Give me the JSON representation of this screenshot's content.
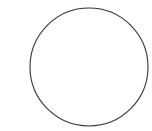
{
  "canvas": {
    "width": 152,
    "height": 131,
    "background": "#ffffff"
  },
  "shape": {
    "type": "circle",
    "cx": 89,
    "cy": 67,
    "r": 59,
    "stroke": "#333333",
    "stroke_width": 1.1,
    "fill": "none"
  }
}
